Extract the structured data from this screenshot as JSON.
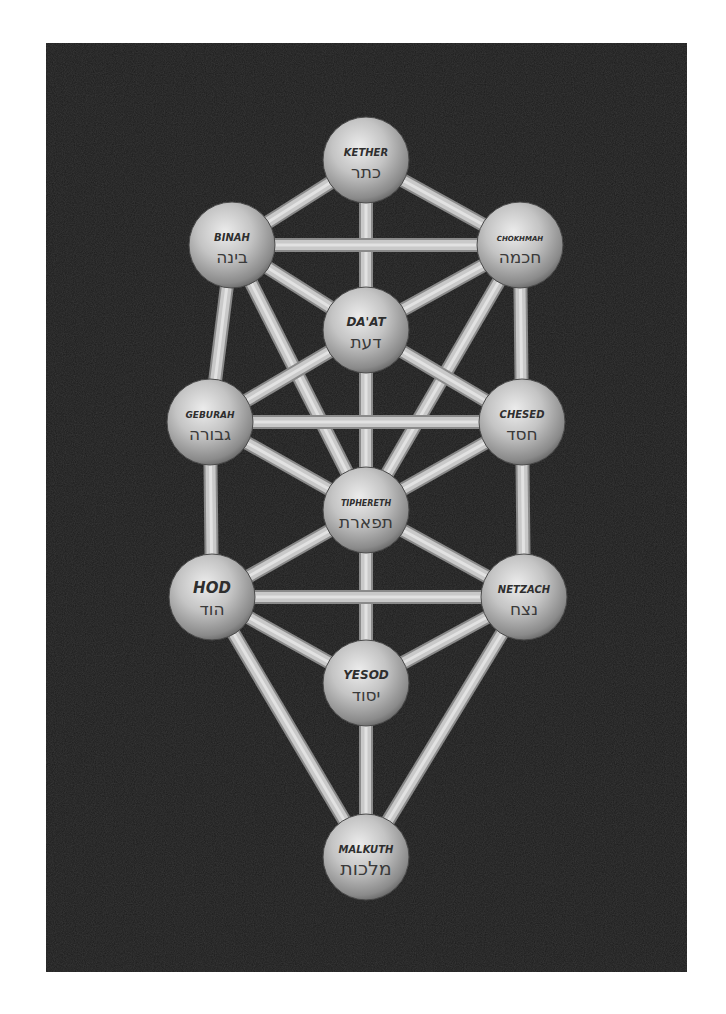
{
  "diagram": {
    "panel": {
      "x": 46,
      "y": 43,
      "width": 641,
      "height": 929,
      "color": "#1c1c1c"
    },
    "colors": {
      "background": "#ffffff",
      "panel": "#1c1c1c",
      "path": "#c9c9c9",
      "path_edge": "#8a8a8a",
      "sphere_light": "#e6e6e6",
      "sphere_mid": "#b5b5b5",
      "sphere_dark": "#6e6e6e",
      "label": "#2e2e2e"
    },
    "sphere_radius": 43,
    "path_width": 12,
    "nodes": [
      {
        "id": "kether",
        "name": "KETHER",
        "hebrew": "כתר",
        "x": 366,
        "y": 160,
        "latin_size": 10,
        "hebrew_size": 17
      },
      {
        "id": "binah",
        "name": "BINAH",
        "hebrew": "בינה",
        "x": 232,
        "y": 245,
        "latin_size": 10,
        "hebrew_size": 17
      },
      {
        "id": "chokhmah",
        "name": "CHOKHMAH",
        "hebrew": "חכמה",
        "x": 520,
        "y": 245,
        "latin_size": 7,
        "hebrew_size": 17
      },
      {
        "id": "daat",
        "name": "DA'AT",
        "hebrew": "דעת",
        "x": 366,
        "y": 330,
        "latin_size": 12,
        "hebrew_size": 17
      },
      {
        "id": "geburah",
        "name": "GEBURAH",
        "hebrew": "גבורה",
        "x": 210,
        "y": 422,
        "latin_size": 9,
        "hebrew_size": 17
      },
      {
        "id": "chesed",
        "name": "CHESED",
        "hebrew": "חסד",
        "x": 522,
        "y": 422,
        "latin_size": 10,
        "hebrew_size": 17
      },
      {
        "id": "tiphereth",
        "name": "TIPHERETH",
        "hebrew": "תפארת",
        "x": 366,
        "y": 510,
        "latin_size": 8,
        "hebrew_size": 17
      },
      {
        "id": "hod",
        "name": "HOD",
        "hebrew": "הוד",
        "x": 212,
        "y": 597,
        "latin_size": 15,
        "hebrew_size": 17
      },
      {
        "id": "netzach",
        "name": "NETZACH",
        "hebrew": "נצח",
        "x": 524,
        "y": 597,
        "latin_size": 10,
        "hebrew_size": 17
      },
      {
        "id": "yesod",
        "name": "YESOD",
        "hebrew": "יסוד",
        "x": 366,
        "y": 683,
        "latin_size": 12,
        "hebrew_size": 17
      },
      {
        "id": "malkuth",
        "name": "MALKUTH",
        "hebrew": "מלכות",
        "x": 366,
        "y": 857,
        "latin_size": 10,
        "hebrew_size": 19
      }
    ],
    "paths": [
      [
        "kether",
        "binah"
      ],
      [
        "kether",
        "chokhmah"
      ],
      [
        "kether",
        "daat"
      ],
      [
        "binah",
        "chokhmah"
      ],
      [
        "binah",
        "daat"
      ],
      [
        "chokhmah",
        "daat"
      ],
      [
        "binah",
        "geburah"
      ],
      [
        "chokhmah",
        "chesed"
      ],
      [
        "binah",
        "tiphereth"
      ],
      [
        "chokhmah",
        "tiphereth"
      ],
      [
        "daat",
        "geburah"
      ],
      [
        "daat",
        "chesed"
      ],
      [
        "daat",
        "tiphereth"
      ],
      [
        "geburah",
        "chesed"
      ],
      [
        "geburah",
        "tiphereth"
      ],
      [
        "chesed",
        "tiphereth"
      ],
      [
        "geburah",
        "hod"
      ],
      [
        "chesed",
        "netzach"
      ],
      [
        "tiphereth",
        "hod"
      ],
      [
        "tiphereth",
        "netzach"
      ],
      [
        "tiphereth",
        "yesod"
      ],
      [
        "hod",
        "netzach"
      ],
      [
        "hod",
        "yesod"
      ],
      [
        "netzach",
        "yesod"
      ],
      [
        "hod",
        "malkuth"
      ],
      [
        "netzach",
        "malkuth"
      ],
      [
        "yesod",
        "malkuth"
      ]
    ]
  }
}
